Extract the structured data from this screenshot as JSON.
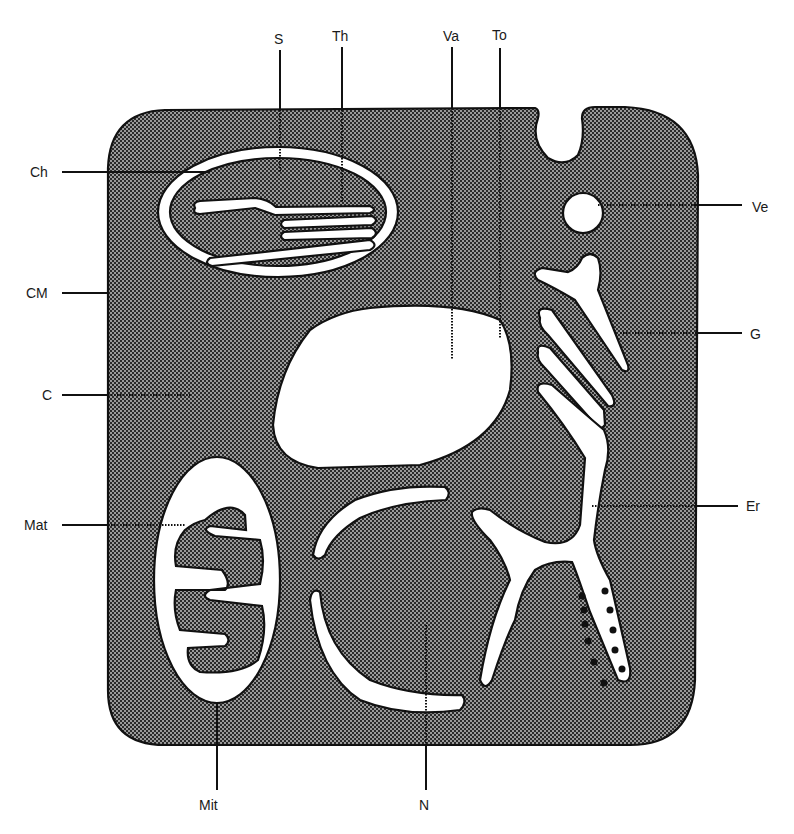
{
  "diagram": {
    "colors": {
      "cytoplasm_fill": "#6e6e6e",
      "organelle_fill": "#ffffff",
      "outline": "#111111",
      "background": "#ffffff"
    },
    "labels": {
      "S": "S",
      "Th": "Th",
      "Va": "Va",
      "To": "To",
      "Ch": "Ch",
      "Ve": "Ve",
      "CM": "CM",
      "G": "G",
      "C": "C",
      "Mat": "Mat",
      "Er": "Er",
      "Mit": "Mit",
      "N": "N"
    },
    "structures": [
      {
        "key": "S",
        "meaning": "stroma"
      },
      {
        "key": "Th",
        "meaning": "thylakoid"
      },
      {
        "key": "Va",
        "meaning": "vacuole"
      },
      {
        "key": "To",
        "meaning": "tonoplast"
      },
      {
        "key": "Ch",
        "meaning": "chloroplast"
      },
      {
        "key": "Ve",
        "meaning": "vesicle"
      },
      {
        "key": "CM",
        "meaning": "cell membrane"
      },
      {
        "key": "G",
        "meaning": "Golgi apparatus"
      },
      {
        "key": "C",
        "meaning": "cytoplasm"
      },
      {
        "key": "Mat",
        "meaning": "mitochondrial matrix"
      },
      {
        "key": "Er",
        "meaning": "endoplasmic reticulum"
      },
      {
        "key": "Mit",
        "meaning": "mitochondrion"
      },
      {
        "key": "N",
        "meaning": "nucleus"
      }
    ]
  }
}
